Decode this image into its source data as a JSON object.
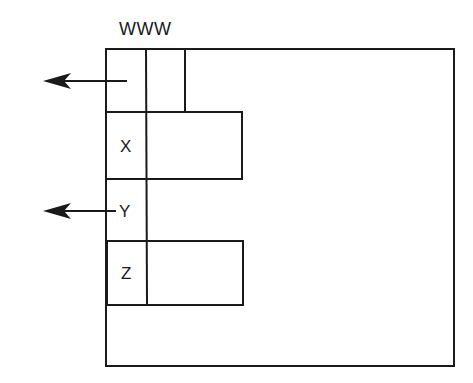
{
  "diagram": {
    "title_label": "WWW",
    "cells": [
      {
        "id": "top",
        "label": ""
      },
      {
        "id": "x",
        "label": "X"
      },
      {
        "id": "y",
        "label": "Y"
      },
      {
        "id": "z",
        "label": "Z"
      }
    ],
    "arrows": [
      {
        "from": "top",
        "direction": "left"
      },
      {
        "from": "y",
        "direction": "left"
      }
    ],
    "colors": {
      "stroke": "#1a1a1a",
      "background": "#ffffff"
    }
  }
}
